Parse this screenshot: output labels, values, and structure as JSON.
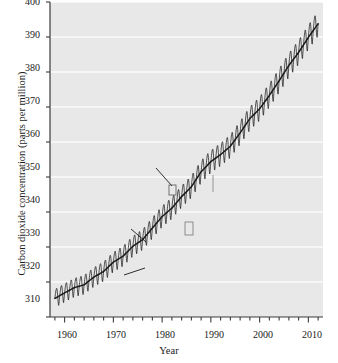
{
  "chart_data": {
    "type": "line",
    "title": "",
    "xlabel": "Year",
    "ylabel": "Carbon dioxide concentration (parts per million)",
    "xlim": [
      1957,
      2013
    ],
    "ylim": [
      310,
      400
    ],
    "xticks": [
      1960,
      1970,
      1980,
      1990,
      2000,
      2010
    ],
    "yticks": [
      310,
      320,
      330,
      340,
      350,
      360,
      370,
      380,
      390,
      400
    ],
    "x_minor_tick_interval": 2,
    "grid": "horizontal-white-faint",
    "legend": "none",
    "plot_background": "#e8e8e8",
    "line_color": "#1a1a1a",
    "series": [
      {
        "name": "Mean",
        "description": "Smoothed annual mean CO2 trend (Keeling curve)",
        "x": [
          1958,
          1960,
          1962,
          1964,
          1966,
          1968,
          1970,
          1972,
          1974,
          1976,
          1978,
          1980,
          1982,
          1984,
          1986,
          1988,
          1990,
          1992,
          1994,
          1996,
          1998,
          2000,
          2002,
          2004,
          2006,
          2008,
          2010,
          2012
        ],
        "values": [
          315.3,
          316.9,
          318.4,
          319.2,
          321.4,
          323.0,
          325.7,
          327.4,
          330.2,
          332.1,
          335.4,
          338.7,
          341.1,
          344.4,
          347.2,
          351.5,
          354.4,
          356.4,
          358.8,
          362.6,
          366.7,
          369.5,
          373.3,
          377.5,
          381.9,
          385.6,
          389.9,
          393.8
        ]
      },
      {
        "name": "Seasonal fluctuation amplitude (peak-to-trough, ppm)",
        "x": [
          1958,
          1970,
          1980,
          1990,
          2000,
          2012
        ],
        "values": [
          5.2,
          5.6,
          6.0,
          6.4,
          6.7,
          7.0
        ]
      }
    ],
    "annotations": [
      {
        "id": "seasonal",
        "text_line1": "Seasonal",
        "text_line2": "fluctuations",
        "color": "#1a1a1a"
      },
      {
        "id": "winter",
        "text": "Winter (high)",
        "color": "#1a1a1a"
      },
      {
        "id": "summer",
        "text": "Summer (low)",
        "color": "#1a1a1a"
      },
      {
        "id": "mean",
        "text": "Mean",
        "color": "#7d7d7d"
      }
    ]
  },
  "axis": {
    "y_title": "Carbon dioxide concentration (parts per million)",
    "x_title": "Year",
    "y_tick_labels": [
      "400",
      "390",
      "380",
      "370",
      "360",
      "350",
      "340",
      "330",
      "320",
      "310"
    ],
    "x_tick_labels": [
      "1960",
      "1970",
      "1980",
      "1990",
      "2000",
      "2010"
    ]
  },
  "annotations": {
    "seasonal_l1": "Seasonal",
    "seasonal_l2": "fluctuations",
    "winter": "Winter (high)",
    "summer": "Summer (low)",
    "mean": "Mean"
  }
}
